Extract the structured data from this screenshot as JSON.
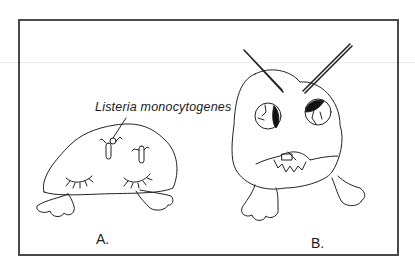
{
  "figure": {
    "annotation": "Listeria monocytogenes",
    "panels": [
      {
        "id": "A",
        "label": "A.",
        "description": "sleeping cell with closed eyes and Listeria bacteria on top"
      },
      {
        "id": "B",
        "label": "B.",
        "description": "angry cell with glaring eyes, furrowed brows and toothy mouth biting bacterium"
      }
    ]
  }
}
